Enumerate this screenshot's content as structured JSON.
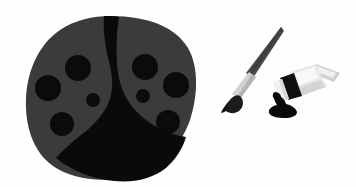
{
  "image": {
    "title": "Ladybug paint palette with paintbrush and paint tube",
    "subject": "flat vector illustration",
    "width": 356,
    "height": 187,
    "background_color": "#fefefe"
  },
  "colors": {
    "background": "#fefefe",
    "wing_gray": "#3b3b3b",
    "body_black": "#0a0a0a",
    "spot_black": "#0b0b0b",
    "brush_handle_gray": "#4a4a4a",
    "brush_ferrule_light": "#d2d2d2",
    "brush_ferrule_shadow": "#b0b0b0",
    "brush_bristle_black": "#1c1c1c",
    "tube_body_light": "#e8e8e8",
    "tube_body_highlight": "#f7f7f7",
    "tube_body_shadow": "#cfcfcf",
    "tube_band_black": "#101010",
    "tube_cap_white": "#f2f2f2",
    "paint_blob_black": "#0a0a0a"
  },
  "objects": [
    {
      "name": "ladybug-palette",
      "label": "Ladybug palette",
      "description": "Rounded oval ladybug body seen from above, dark gray wings split by a black center stripe that widens into a black base, with eight black round spots",
      "bounds": {
        "x": 25,
        "y": 16,
        "width": 171,
        "height": 164
      }
    },
    {
      "name": "paintbrush",
      "label": "Paintbrush",
      "description": "Diagonal brush with dark gray tapered handle, light gray metal ferrule and black loaded bristle tip pointing down-left",
      "bounds": {
        "x": 222,
        "y": 26,
        "width": 62,
        "height": 92
      }
    },
    {
      "name": "paint-tube",
      "label": "Paint tube",
      "description": "Squeezed light gray paint tube angled up-right with black shoulder band, white cap and a black paint blob spilling below the nozzle",
      "bounds": {
        "x": 262,
        "y": 62,
        "width": 78,
        "height": 56
      }
    }
  ],
  "palette_spots": {
    "label": "Paint wells",
    "total": 8,
    "left_wing": [
      {
        "cx": 78,
        "cy": 68,
        "r": 13,
        "size": "large"
      },
      {
        "cx": 48,
        "cy": 88,
        "r": 13,
        "size": "large"
      },
      {
        "cx": 93,
        "cy": 100,
        "r": 7,
        "size": "small"
      },
      {
        "cx": 62,
        "cy": 124,
        "r": 12,
        "size": "large"
      }
    ],
    "right_wing": [
      {
        "cx": 145,
        "cy": 67,
        "r": 13,
        "size": "large"
      },
      {
        "cx": 176,
        "cy": 85,
        "r": 13,
        "size": "large"
      },
      {
        "cx": 143,
        "cy": 96,
        "r": 7,
        "size": "small"
      },
      {
        "cx": 168,
        "cy": 122,
        "r": 12,
        "size": "large"
      }
    ]
  }
}
